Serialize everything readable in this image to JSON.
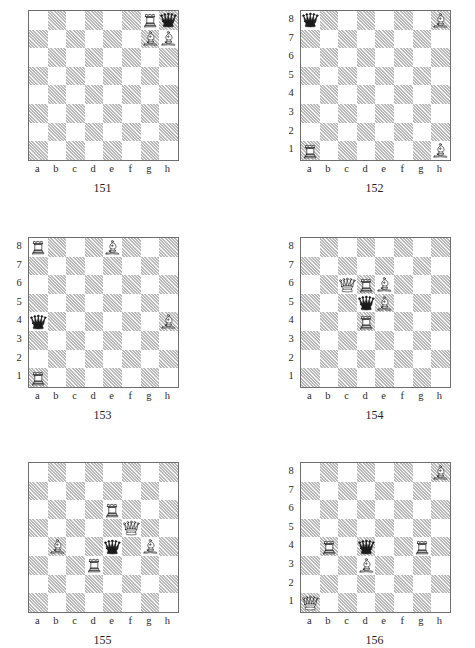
{
  "page": {
    "piece_glyph_names": {
      "white_rook": "white-rook-icon",
      "white_bishop": "white-bishop-icon",
      "white_queen": "white-queen-icon",
      "black_queen": "black-queen-icon"
    },
    "colors": {
      "dark_square": "#b9b9b9",
      "light_square": "#ffffff",
      "board_border": "#6e6e6e",
      "text": "#1f1f1f"
    }
  },
  "coordinates": {
    "files": [
      "a",
      "b",
      "c",
      "d",
      "e",
      "f",
      "g",
      "h"
    ],
    "ranks": [
      "8",
      "7",
      "6",
      "5",
      "4",
      "3",
      "2",
      "1"
    ]
  },
  "diagrams": [
    {
      "number": "151",
      "column": "left",
      "show_ranks": false,
      "show_files": true,
      "pieces": [
        {
          "square": "g8",
          "piece": "white_rook"
        },
        {
          "square": "h8",
          "piece": "black_queen"
        },
        {
          "square": "g7",
          "piece": "white_bishop"
        },
        {
          "square": "h7",
          "piece": "white_bishop"
        }
      ]
    },
    {
      "number": "152",
      "column": "right",
      "show_ranks": true,
      "show_files": true,
      "pieces": [
        {
          "square": "a8",
          "piece": "black_queen"
        },
        {
          "square": "h8",
          "piece": "white_bishop"
        },
        {
          "square": "a1",
          "piece": "white_rook"
        },
        {
          "square": "h1",
          "piece": "white_bishop"
        }
      ]
    },
    {
      "number": "153",
      "column": "left",
      "show_ranks": true,
      "show_files": true,
      "pieces": [
        {
          "square": "a8",
          "piece": "white_rook"
        },
        {
          "square": "e8",
          "piece": "white_bishop"
        },
        {
          "square": "a4",
          "piece": "black_queen"
        },
        {
          "square": "h4",
          "piece": "white_bishop"
        },
        {
          "square": "a1",
          "piece": "white_rook"
        }
      ]
    },
    {
      "number": "154",
      "column": "right",
      "show_ranks": true,
      "show_files": true,
      "pieces": [
        {
          "square": "c6",
          "piece": "white_queen"
        },
        {
          "square": "d6",
          "piece": "white_rook"
        },
        {
          "square": "e6",
          "piece": "white_bishop"
        },
        {
          "square": "d5",
          "piece": "black_queen"
        },
        {
          "square": "e5",
          "piece": "white_bishop"
        },
        {
          "square": "d4",
          "piece": "white_rook"
        }
      ]
    },
    {
      "number": "155",
      "column": "left",
      "show_ranks": false,
      "show_files": true,
      "pieces": [
        {
          "square": "e6",
          "piece": "white_rook"
        },
        {
          "square": "f5",
          "piece": "white_queen"
        },
        {
          "square": "b4",
          "piece": "white_bishop"
        },
        {
          "square": "e4",
          "piece": "black_queen"
        },
        {
          "square": "g4",
          "piece": "white_bishop"
        },
        {
          "square": "d3",
          "piece": "white_rook"
        }
      ]
    },
    {
      "number": "156",
      "column": "right",
      "show_ranks": true,
      "show_files": true,
      "pieces": [
        {
          "square": "h8",
          "piece": "white_bishop"
        },
        {
          "square": "b4",
          "piece": "white_rook"
        },
        {
          "square": "d4",
          "piece": "black_queen"
        },
        {
          "square": "g4",
          "piece": "white_rook"
        },
        {
          "square": "d3",
          "piece": "white_bishop"
        },
        {
          "square": "a1",
          "piece": "white_queen"
        }
      ]
    }
  ]
}
